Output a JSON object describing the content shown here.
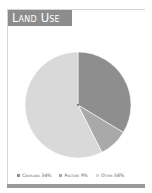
{
  "title": "Land Use",
  "colors": {
    "title_bg": "#8c8c8c",
    "cropland": "#8e8e8e",
    "pasture": "#a9a9a9",
    "other": "#d9d9d9"
  },
  "legend": [
    {
      "label": "Cropland 34%",
      "color": "#8e8e8e"
    },
    {
      "label": "Pasture 9%",
      "color": "#a9a9a9"
    },
    {
      "label": "Other 58%",
      "color": "#d9d9d9"
    }
  ],
  "chart_data": {
    "type": "pie",
    "title": "Land Use",
    "categories": [
      "Cropland",
      "Pasture",
      "Other"
    ],
    "values": [
      34,
      9,
      58
    ],
    "unit": "%",
    "colors": [
      "#8e8e8e",
      "#a9a9a9",
      "#d9d9d9"
    ],
    "start_angle_deg": 0,
    "direction": "clockwise",
    "legend_position": "bottom"
  }
}
